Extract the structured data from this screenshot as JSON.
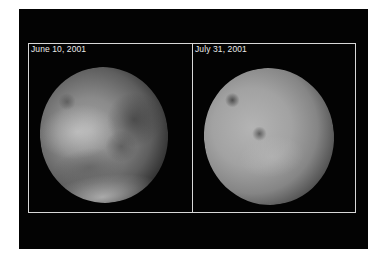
{
  "figure": {
    "panels": [
      {
        "label": "June 10, 2001",
        "subject": "planet-disk-clear",
        "description": "Mars with visible surface features and bright southern polar cap"
      },
      {
        "label": "July 31, 2001",
        "subject": "planet-disk-dust-storm",
        "description": "Mars obscured by global dust storm"
      }
    ],
    "colors": {
      "background": "#ffffff",
      "panel": "#030303",
      "frame": "#d8d8d8",
      "label_text": "#e8e8e8"
    }
  }
}
